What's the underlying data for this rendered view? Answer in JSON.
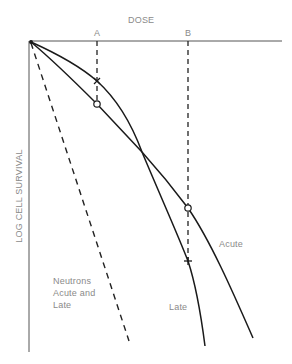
{
  "figure": {
    "x_axis_label": "DOSE",
    "y_axis_label": "LOG CELL SURVIVAL",
    "dose_markers": [
      {
        "id": "A",
        "label": "A"
      },
      {
        "id": "B",
        "label": "B"
      }
    ],
    "curves": {
      "acute_label": "Acute",
      "late_label": "Late",
      "neutrons_label_lines": [
        "Neutrons",
        "Acute and",
        "Late"
      ]
    },
    "point_markers": [
      {
        "dose": "A",
        "curve": "Late",
        "symbol": "×"
      },
      {
        "dose": "A",
        "curve": "Acute",
        "symbol": "○"
      },
      {
        "dose": "B",
        "curve": "Acute",
        "symbol": "○"
      },
      {
        "dose": "B",
        "curve": "Late",
        "symbol": "+"
      }
    ],
    "colors": {
      "line": "#1a1a1a",
      "text": "#8a8a8a",
      "background": "#ffffff"
    }
  }
}
